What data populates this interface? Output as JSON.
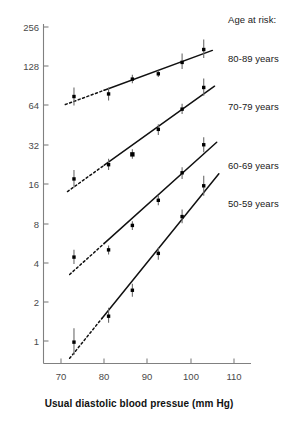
{
  "chart_data": {
    "type": "scatter",
    "title": "",
    "xlabel": "Usual diastolic blood pressue (mm Hg)",
    "ylabel": "",
    "xlim": [
      65,
      114
    ],
    "ylim": [
      0.62,
      300
    ],
    "yscale": "log2",
    "xticks": [
      70,
      80,
      90,
      100,
      110
    ],
    "yticks": [
      1,
      2,
      4,
      8,
      16,
      32,
      64,
      128,
      256
    ],
    "xtick_labels": [
      "70",
      "80",
      "90",
      "100",
      "110"
    ],
    "ytick_labels": [
      "1",
      "2",
      "4",
      "8",
      "16",
      "32",
      "64",
      "128",
      "256"
    ],
    "grid": false,
    "legend_position": "right",
    "legend_title": "Age at risk:",
    "series": [
      {
        "name": "80-89 years",
        "points": [
          {
            "x": 73.0,
            "y": 75.0,
            "ci_low": 64.0,
            "ci_high": 88.0
          },
          {
            "x": 81.0,
            "y": 78.5,
            "ci_low": 70.0,
            "ci_high": 88.0
          },
          {
            "x": 86.5,
            "y": 102.0,
            "ci_low": 95.0,
            "ci_high": 110.0
          },
          {
            "x": 92.5,
            "y": 112.0,
            "ci_low": 106.0,
            "ci_high": 119.0
          },
          {
            "x": 98.0,
            "y": 137.0,
            "ci_low": 122.0,
            "ci_high": 160.0
          },
          {
            "x": 103.0,
            "y": 172.0,
            "ci_low": 148.0,
            "ci_high": 205.0
          }
        ],
        "fit_line": {
          "x_start": 80.0,
          "x_end": 105.0,
          "style": "solid"
        },
        "extrapolation": {
          "x_start": 71.0,
          "x_end": 80.0,
          "style": "dashed"
        }
      },
      {
        "name": "70-79 years",
        "points": [
          {
            "x": 73.0,
            "y": 17.5,
            "ci_low": 15.0,
            "ci_high": 20.5
          },
          {
            "x": 81.0,
            "y": 22.5,
            "ci_low": 20.5,
            "ci_high": 25.0
          },
          {
            "x": 86.5,
            "y": 27.0,
            "ci_low": 25.0,
            "ci_high": 29.5
          },
          {
            "x": 92.5,
            "y": 42.0,
            "ci_low": 38.0,
            "ci_high": 46.0
          },
          {
            "x": 98.0,
            "y": 60.0,
            "ci_low": 55.0,
            "ci_high": 66.0
          },
          {
            "x": 103.0,
            "y": 88.0,
            "ci_low": 76.0,
            "ci_high": 103.0
          }
        ],
        "fit_line": {
          "x_start": 80.0,
          "x_end": 105.5,
          "style": "solid"
        },
        "extrapolation": {
          "x_start": 71.5,
          "x_end": 80.0,
          "style": "dashed"
        }
      },
      {
        "name": "60-69 years",
        "points": [
          {
            "x": 73.0,
            "y": 4.4,
            "ci_low": 3.9,
            "ci_high": 5.0
          },
          {
            "x": 81.0,
            "y": 5.0,
            "ci_low": 4.6,
            "ci_high": 5.4
          },
          {
            "x": 86.5,
            "y": 7.7,
            "ci_low": 7.1,
            "ci_high": 8.3
          },
          {
            "x": 92.5,
            "y": 12.0,
            "ci_low": 11.0,
            "ci_high": 13.2
          },
          {
            "x": 98.0,
            "y": 19.5,
            "ci_low": 17.5,
            "ci_high": 21.5
          },
          {
            "x": 103.0,
            "y": 32.0,
            "ci_low": 28.0,
            "ci_high": 36.5
          }
        ],
        "fit_line": {
          "x_start": 80.0,
          "x_end": 106.0,
          "style": "solid"
        },
        "extrapolation": {
          "x_start": 72.0,
          "x_end": 80.0,
          "style": "dashed"
        }
      },
      {
        "name": "50-59 years",
        "points": [
          {
            "x": 73.0,
            "y": 0.98,
            "ci_low": 0.78,
            "ci_high": 1.25
          },
          {
            "x": 81.0,
            "y": 1.55,
            "ci_low": 1.38,
            "ci_high": 1.8
          },
          {
            "x": 86.5,
            "y": 2.45,
            "ci_low": 2.18,
            "ci_high": 2.75
          },
          {
            "x": 92.5,
            "y": 4.7,
            "ci_low": 4.2,
            "ci_high": 5.2
          },
          {
            "x": 98.0,
            "y": 9.0,
            "ci_low": 8.0,
            "ci_high": 10.2
          },
          {
            "x": 103.0,
            "y": 15.5,
            "ci_low": 13.0,
            "ci_high": 18.5
          }
        ],
        "fit_line": {
          "x_start": 79.5,
          "x_end": 106.5,
          "style": "solid"
        },
        "extrapolation": {
          "x_start": 72.0,
          "x_end": 79.5,
          "style": "dashed"
        }
      }
    ]
  },
  "legend": {
    "title": "Age at risk:",
    "entries": [
      {
        "label": "80-89 years"
      },
      {
        "label": "70-79 years"
      },
      {
        "label": "60-69 years"
      },
      {
        "label": "50-59 years"
      }
    ]
  },
  "axes": {
    "x_title": "Usual diastolic blood pressue (mm Hg)",
    "x_tick_labels": [
      "70",
      "80",
      "90",
      "100",
      "110"
    ],
    "y_tick_labels": [
      "256",
      "128",
      "64",
      "32",
      "16",
      "8",
      "4",
      "2",
      "1"
    ]
  },
  "colors": {
    "marker": "#000000",
    "line": "#111111",
    "whisker": "#6b6b6b",
    "axis": "#808080",
    "tick_text": "#4a4a4a",
    "legend_text": "#1a1a1a",
    "background": "#ffffff"
  }
}
